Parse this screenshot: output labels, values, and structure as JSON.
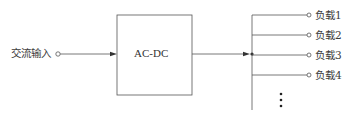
{
  "diagram": {
    "input": {
      "label": "交流输入"
    },
    "converter": {
      "label": "AC-DC"
    },
    "loads": [
      {
        "label": "负载1"
      },
      {
        "label": "负载2"
      },
      {
        "label": "负载3"
      },
      {
        "label": "负载4"
      }
    ],
    "ellipsis": "⋮",
    "colors": {
      "line": "#555555",
      "text": "#3a3a3a",
      "background": "#ffffff"
    }
  }
}
